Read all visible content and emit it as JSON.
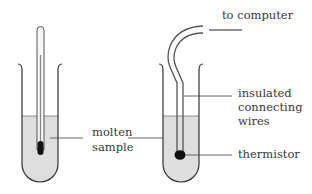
{
  "diagram": {
    "left_apparatus": {
      "instrument": "thermometer",
      "labels": {
        "sample_line1": "molten",
        "sample_line2": "sample"
      }
    },
    "right_apparatus": {
      "instrument": "thermistor",
      "labels": {
        "to_computer": "to computer",
        "wires_line1": "insulated",
        "wires_line2": "connecting",
        "wires_line3": "wires",
        "thermistor": "thermistor"
      }
    },
    "colors": {
      "liquid": "#dedede",
      "outline": "#333333",
      "bulb": "#111111",
      "leader": "#555555"
    }
  }
}
